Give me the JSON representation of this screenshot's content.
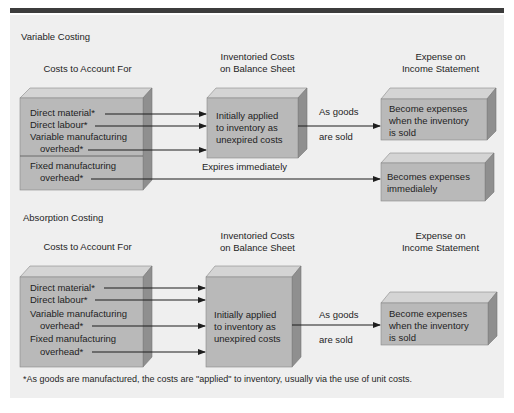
{
  "colors": {
    "header_bar": "#3c3c3c",
    "panel_bg": "#efefef",
    "box_front": "#b9b9b9",
    "box_top": "#d4d4d4",
    "box_side": "#8f8f8f",
    "arrow": "#1e1e1e"
  },
  "variable_costing": {
    "title": "Variable Costing",
    "col_costs": "Costs to Account For",
    "col_inventory_line1": "Inventoried Costs",
    "col_inventory_line2": "on Balance Sheet",
    "col_expense_line1": "Expense on",
    "col_expense_line2": "Income Statement",
    "costs_box": {
      "direct_material": "Direct material*",
      "direct_labour": "Direct labour*",
      "variable_mfg_line1": "Variable manufacturing",
      "variable_mfg_line2": "overhead*",
      "fixed_mfg_line1": "Fixed manufacturing",
      "fixed_mfg_line2": "overhead*"
    },
    "inventory_box": {
      "line1": "Initially  applied",
      "line2": "to inventory as",
      "line3": "unexpired costs"
    },
    "arrow_label_top": "As goods",
    "arrow_label_bottom": "are sold",
    "expense_box": {
      "line1": "Become expenses",
      "line2": "when the inventory",
      "line3": "is sold"
    },
    "expires_label": "Expires immediately",
    "period_expense_box": {
      "line1": "Becomes expenses",
      "line2": "immedialely"
    }
  },
  "absorption_costing": {
    "title": "Absorption Costing",
    "col_costs": "Costs to Account For",
    "col_inventory_line1": "Inventoried Costs",
    "col_inventory_line2": "on Balance Sheet",
    "col_expense_line1": "Expense on",
    "col_expense_line2": "Income Statement",
    "costs_box": {
      "direct_material": "Direct material*",
      "direct_labour": "Direct labour*",
      "variable_mfg_line1": "Variable manufacturing",
      "variable_mfg_line2": "overhead*",
      "fixed_mfg_line1": "Fixed manufacturing",
      "fixed_mfg_line2": "overhead*"
    },
    "inventory_box": {
      "line1": "Initially  applied",
      "line2": "to inventory as",
      "line3": "unexpired costs"
    },
    "arrow_label_top": "As goods",
    "arrow_label_bottom": "are sold",
    "expense_box": {
      "line1": "Become expenses",
      "line2": "when the inventory",
      "line3": "is sold"
    }
  },
  "footnote": "*As goods are manufactured, the costs are \"applied\" to inventory, usually via the use of unit costs."
}
